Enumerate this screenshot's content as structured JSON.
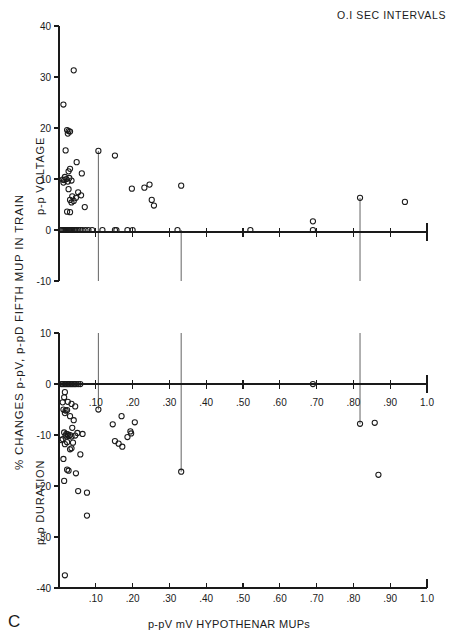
{
  "figure": {
    "panel_letter": "C",
    "header_note": "O.I SEC INTERVALS",
    "xlabel": "p-pV mV HYPOTHENAR MUPs",
    "ylabel_main": "% CHANGES p-pV, p-pD FIFTH MUP IN TRAIN",
    "ylabel_top": "p-p VOLTAGE",
    "ylabel_bottom": "p-p DURATION",
    "ink_color": "#1a1a1a",
    "marker_color": "#1a1a1a"
  },
  "chart_data": [
    {
      "type": "scatter",
      "title": "p-p VOLTAGE",
      "subtitle": "O.I SEC INTERVALS",
      "xlabel": "p-pV mV HYPOTHENAR MUPs",
      "ylabel": "p-p VOLTAGE",
      "ylabel_outer": "% CHANGES p-pV, p-pD FIFTH MUP IN TRAIN",
      "xlim": [
        0,
        1.0
      ],
      "ylim": [
        -10,
        40
      ],
      "xticks": [
        0.1,
        0.2,
        0.3,
        0.4,
        0.5,
        0.6,
        0.7,
        0.8,
        0.9,
        1.0
      ],
      "xticklabels": [
        ".10",
        ".20",
        ".30",
        ".40",
        ".50",
        ".60",
        ".70",
        ".80",
        ".90",
        "1.0"
      ],
      "yticks": [
        -10,
        0,
        10,
        20,
        30,
        40
      ],
      "yticklabels": [
        "-10",
        "0",
        "10",
        "20",
        "30",
        "40"
      ],
      "grid": false,
      "legend": null,
      "zero_line": 0,
      "points": [
        [
          0.04,
          31.3
        ],
        [
          0.012,
          24.6
        ],
        [
          0.022,
          19.6
        ],
        [
          0.026,
          19.4
        ],
        [
          0.03,
          19.3
        ],
        [
          0.024,
          18.9
        ],
        [
          0.018,
          15.6
        ],
        [
          0.107,
          15.5
        ],
        [
          0.152,
          14.6
        ],
        [
          0.048,
          13.3
        ],
        [
          0.03,
          12.0
        ],
        [
          0.026,
          11.5
        ],
        [
          0.062,
          11.1
        ],
        [
          0.016,
          10.4
        ],
        [
          0.028,
          10.2
        ],
        [
          0.02,
          10.0
        ],
        [
          0.01,
          9.9
        ],
        [
          0.014,
          9.8
        ],
        [
          0.034,
          9.7
        ],
        [
          0.024,
          9.5
        ],
        [
          0.012,
          9.3
        ],
        [
          0.198,
          8.1
        ],
        [
          0.232,
          8.3
        ],
        [
          0.246,
          8.9
        ],
        [
          0.332,
          8.7
        ],
        [
          0.026,
          8.0
        ],
        [
          0.052,
          7.4
        ],
        [
          0.06,
          6.8
        ],
        [
          0.036,
          6.6
        ],
        [
          0.046,
          6.3
        ],
        [
          0.03,
          5.9
        ],
        [
          0.04,
          5.7
        ],
        [
          0.034,
          5.4
        ],
        [
          0.252,
          5.9
        ],
        [
          0.258,
          4.8
        ],
        [
          0.07,
          4.5
        ],
        [
          0.022,
          3.6
        ],
        [
          0.03,
          3.5
        ],
        [
          0.005,
          0.0
        ],
        [
          0.009,
          0.0
        ],
        [
          0.012,
          0.0
        ],
        [
          0.015,
          0.0
        ],
        [
          0.018,
          0.0
        ],
        [
          0.021,
          0.0
        ],
        [
          0.024,
          0.0
        ],
        [
          0.027,
          0.0
        ],
        [
          0.03,
          0.0
        ],
        [
          0.033,
          0.0
        ],
        [
          0.036,
          0.0
        ],
        [
          0.04,
          0.0
        ],
        [
          0.044,
          0.0
        ],
        [
          0.048,
          0.0
        ],
        [
          0.053,
          0.0
        ],
        [
          0.058,
          0.0
        ],
        [
          0.064,
          0.0
        ],
        [
          0.072,
          0.0
        ],
        [
          0.08,
          0.0
        ],
        [
          0.09,
          0.0
        ],
        [
          0.118,
          0.0
        ],
        [
          0.152,
          0.0
        ],
        [
          0.156,
          0.0
        ],
        [
          0.186,
          0.0
        ],
        [
          0.2,
          0.0
        ],
        [
          0.322,
          0.0
        ],
        [
          0.52,
          0.0
        ],
        [
          0.69,
          0.0
        ],
        [
          0.69,
          1.7
        ],
        [
          0.818,
          6.3
        ],
        [
          0.94,
          5.5
        ]
      ]
    },
    {
      "type": "scatter",
      "title": "p-p DURATION",
      "xlabel": "p-pV mV HYPOTHENAR MUPs",
      "ylabel": "p-p DURATION",
      "ylabel_outer": "% CHANGES p-pV, p-pD FIFTH MUP IN TRAIN",
      "xlim": [
        0,
        1.0
      ],
      "ylim": [
        -40,
        10
      ],
      "xticks": [
        0.1,
        0.2,
        0.3,
        0.4,
        0.5,
        0.6,
        0.7,
        0.8,
        0.9,
        1.0
      ],
      "xticklabels": [
        ".10",
        ".20",
        ".30",
        ".40",
        ".50",
        ".60",
        ".70",
        ".80",
        ".90",
        "1.0"
      ],
      "yticks": [
        -40,
        -30,
        -20,
        -10,
        0,
        10
      ],
      "yticklabels": [
        "-40",
        "-30",
        "-20",
        "-10",
        "0",
        "10"
      ],
      "grid": false,
      "legend": null,
      "zero_line": 0,
      "points": [
        [
          0.006,
          0.0
        ],
        [
          0.01,
          0.0
        ],
        [
          0.014,
          0.0
        ],
        [
          0.018,
          0.0
        ],
        [
          0.022,
          0.0
        ],
        [
          0.026,
          0.0
        ],
        [
          0.03,
          0.0
        ],
        [
          0.034,
          0.0
        ],
        [
          0.038,
          0.0
        ],
        [
          0.042,
          0.0
        ],
        [
          0.046,
          0.0
        ],
        [
          0.052,
          0.0
        ],
        [
          0.058,
          0.0
        ],
        [
          0.69,
          0.0
        ],
        [
          0.016,
          -1.6
        ],
        [
          0.014,
          -2.6
        ],
        [
          0.01,
          -3.6
        ],
        [
          0.024,
          -3.5
        ],
        [
          0.034,
          -3.9
        ],
        [
          0.012,
          -5.0
        ],
        [
          0.018,
          -5.2
        ],
        [
          0.022,
          -5.1
        ],
        [
          0.016,
          -5.7
        ],
        [
          0.044,
          -4.4
        ],
        [
          0.107,
          -5.0
        ],
        [
          0.17,
          -6.3
        ],
        [
          0.03,
          -6.3
        ],
        [
          0.04,
          -7.1
        ],
        [
          0.146,
          -7.9
        ],
        [
          0.206,
          -7.5
        ],
        [
          0.818,
          -7.8
        ],
        [
          0.858,
          -7.6
        ],
        [
          0.036,
          -8.6
        ],
        [
          0.194,
          -9.3
        ],
        [
          0.014,
          -9.5
        ],
        [
          0.02,
          -9.8
        ],
        [
          0.024,
          -9.9
        ],
        [
          0.018,
          -10.1
        ],
        [
          0.026,
          -10.2
        ],
        [
          0.03,
          -10.0
        ],
        [
          0.034,
          -10.3
        ],
        [
          0.044,
          -10.1
        ],
        [
          0.01,
          -10.8
        ],
        [
          0.006,
          -11.0
        ],
        [
          0.05,
          -9.6
        ],
        [
          0.064,
          -9.8
        ],
        [
          0.186,
          -10.4
        ],
        [
          0.196,
          -9.7
        ],
        [
          0.022,
          -11.4
        ],
        [
          0.016,
          -11.8
        ],
        [
          0.038,
          -11.5
        ],
        [
          0.152,
          -11.2
        ],
        [
          0.162,
          -11.7
        ],
        [
          0.172,
          -12.3
        ],
        [
          0.03,
          -12.8
        ],
        [
          0.034,
          -12.6
        ],
        [
          0.058,
          -13.8
        ],
        [
          0.012,
          -14.7
        ],
        [
          0.022,
          -16.8
        ],
        [
          0.026,
          -17.0
        ],
        [
          0.046,
          -17.5
        ],
        [
          0.332,
          -17.2
        ],
        [
          0.868,
          -17.8
        ],
        [
          0.014,
          -19.0
        ],
        [
          0.052,
          -21.0
        ],
        [
          0.076,
          -21.3
        ],
        [
          0.076,
          -25.8
        ],
        [
          0.016,
          -37.5
        ]
      ]
    }
  ],
  "reference_lines": [
    {
      "x": 0.107,
      "top_y": 15.5,
      "bottom_y": -5.0
    },
    {
      "x": 0.332,
      "top_y": 0.0,
      "bottom_y": -17.2
    },
    {
      "x": 0.818,
      "top_y": 6.3,
      "bottom_y": -7.8
    }
  ]
}
